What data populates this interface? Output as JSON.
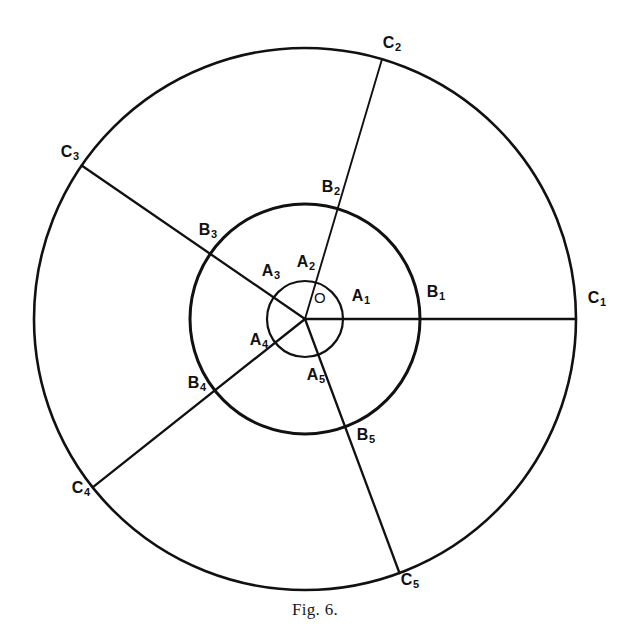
{
  "figure": {
    "caption": "Fig. 6.",
    "stroke_color": "#111111",
    "background_color": "#ffffff"
  },
  "chart_data": {
    "type": "diagram",
    "title": "Fig. 6.",
    "center": {
      "label": "O",
      "x": 305,
      "y": 319,
      "label_x": 320,
      "label_y": 297
    },
    "circles": [
      {
        "name": "inner-circle",
        "radius": 38,
        "stroke_width": 2.2
      },
      {
        "name": "middle-circle",
        "radius": 115,
        "stroke_width": 3.0
      },
      {
        "name": "outer-circle",
        "radius": 271,
        "stroke_width": 2.6
      }
    ],
    "rays": [
      {
        "index": 1,
        "angle_deg": 0.0,
        "inner": {
          "label": "A",
          "sub": "1",
          "label_x": 361,
          "label_y": 297
        },
        "middle": {
          "label": "B",
          "sub": "1",
          "label_x": 436,
          "label_y": 293
        },
        "outer": {
          "label": "C",
          "sub": "1",
          "label_x": 597,
          "label_y": 299
        }
      },
      {
        "index": 2,
        "angle_deg": 73.5,
        "inner": {
          "label": "A",
          "sub": "2",
          "label_x": 306,
          "label_y": 263
        },
        "middle": {
          "label": "B",
          "sub": "2",
          "label_x": 331,
          "label_y": 188
        },
        "outer": {
          "label": "C",
          "sub": "2",
          "label_x": 392,
          "label_y": 44
        }
      },
      {
        "index": 3,
        "angle_deg": 145.5,
        "inner": {
          "label": "A",
          "sub": "3",
          "label_x": 271,
          "label_y": 272
        },
        "middle": {
          "label": "B",
          "sub": "3",
          "label_x": 208,
          "label_y": 231
        },
        "outer": {
          "label": "C",
          "sub": "3",
          "label_x": 70,
          "label_y": 153
        }
      },
      {
        "index": 4,
        "angle_deg": 218.4,
        "inner": {
          "label": "A",
          "sub": "4",
          "label_x": 259,
          "label_y": 341
        },
        "middle": {
          "label": "B",
          "sub": "4",
          "label_x": 197,
          "label_y": 384
        },
        "outer": {
          "label": "C",
          "sub": "4",
          "label_x": 81,
          "label_y": 489
        }
      },
      {
        "index": 5,
        "angle_deg": 290.4,
        "inner": {
          "label": "A",
          "sub": "5",
          "label_x": 316,
          "label_y": 376
        },
        "middle": {
          "label": "B",
          "sub": "5",
          "label_x": 366,
          "label_y": 436
        },
        "outer": {
          "label": "C",
          "sub": "5",
          "label_x": 410,
          "label_y": 581
        }
      }
    ]
  }
}
